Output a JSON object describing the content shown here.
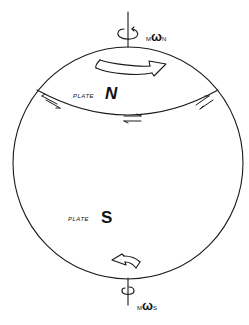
{
  "figure": {
    "type": "sphere-plate-diagram",
    "colors": {
      "ink": "#1a1a1a",
      "background": "#ffffff"
    }
  },
  "labels": {
    "plate_n": {
      "prefix": "PLATE",
      "name": "N"
    },
    "plate_s": {
      "prefix": "PLATE",
      "name": "S"
    },
    "omega_n": {
      "pre": "M",
      "symbol": "ω",
      "sub": "N"
    },
    "omega_s": {
      "pre": "M",
      "symbol": "ω",
      "sub": "S"
    }
  },
  "elements": {
    "sphere": {
      "cx": 128,
      "cy": 163,
      "rx": 115,
      "ry": 116
    },
    "rotation_axis": "vertical through poles",
    "plate_boundary": "arc across northern hemisphere with opposing shear-arrow pairs",
    "motion_arrows": [
      "north plate arrow pointing east",
      "south plate arrow pointing west"
    ]
  }
}
